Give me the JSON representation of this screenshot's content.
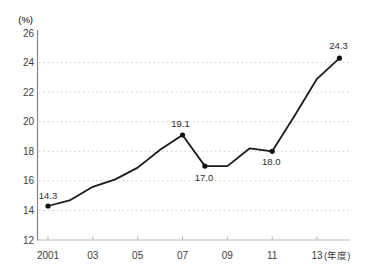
{
  "chart_data": {
    "type": "line",
    "title": "",
    "xlabel": "",
    "ylabel": "",
    "ylabel_unit": "(%)",
    "x_axis_suffix": "(年度)",
    "x": [
      2001,
      2002,
      2003,
      2004,
      2005,
      2006,
      2007,
      2008,
      2009,
      2010,
      2011,
      2012,
      2013,
      2014
    ],
    "values": [
      14.3,
      14.7,
      15.6,
      16.1,
      16.9,
      18.1,
      19.1,
      17.0,
      17.0,
      18.2,
      18.0,
      20.4,
      22.9,
      24.3
    ],
    "x_tick_years": [
      2001,
      2003,
      2005,
      2007,
      2009,
      2011,
      2013
    ],
    "x_tick_labels": [
      "2001",
      "03",
      "05",
      "07",
      "09",
      "11",
      "13"
    ],
    "y_ticks": [
      12,
      14,
      16,
      18,
      20,
      22,
      24,
      26
    ],
    "y_tick_labels": [
      "12",
      "14",
      "16",
      "18",
      "20",
      "22",
      "24",
      "26"
    ],
    "ylim": [
      12,
      26
    ],
    "xlim": [
      2001,
      2014
    ],
    "grid_y": [
      14,
      16,
      18,
      20,
      22,
      24
    ],
    "grid_style": "dotted-horizontal",
    "legend": "none",
    "marked_points": [
      2001,
      2007,
      2008,
      2011,
      2014
    ],
    "annotations": [
      {
        "x": 2001,
        "value": 14.3,
        "text": "14.3",
        "dx": 0,
        "dy": -7
      },
      {
        "x": 2007,
        "value": 19.1,
        "text": "19.1",
        "dx": -2,
        "dy": -8
      },
      {
        "x": 2008,
        "value": 17.0,
        "text": "17.0",
        "dx": -1,
        "dy": 15
      },
      {
        "x": 2011,
        "value": 18.0,
        "text": "18.0",
        "dx": -1,
        "dy": 14
      },
      {
        "x": 2014,
        "value": 24.3,
        "text": "24.3",
        "dx": -1,
        "dy": -9
      }
    ],
    "colors": {
      "line": "#1b1b1b",
      "marker": "#111111",
      "grid": "#cdcdcd",
      "y_axis": "#868686",
      "x_axis": "#b5b5b5",
      "tick": "#b5b5b5",
      "tick_text": "#3c3c3c",
      "annotation_text": "#2e2e2e",
      "background": "#ffffff"
    }
  }
}
